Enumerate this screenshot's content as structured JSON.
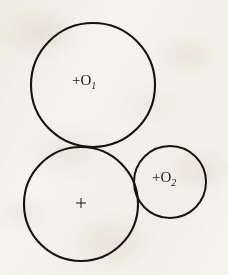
{
  "figure": {
    "name": "three-tangent-circles",
    "background_color": "#f6f4ef",
    "ink_color": "#17140f",
    "media": "scanned-book-page",
    "canvas": {
      "width": 228,
      "height": 275
    }
  },
  "circles": [
    {
      "id": "circle-o1",
      "label": "O",
      "subscript": "1",
      "plus_prefix": "+",
      "center_x": 93,
      "center_y": 85,
      "radius": 62,
      "stroke_width": 2.1,
      "label_x": 72,
      "label_y": 85,
      "has_center_mark": false
    },
    {
      "id": "circle-unlabeled",
      "label": "",
      "subscript": "",
      "plus_prefix": "+",
      "center_x": 81,
      "center_y": 204,
      "radius": 57,
      "stroke_width": 2.1,
      "label_x": 76,
      "label_y": 204,
      "has_center_mark": true
    },
    {
      "id": "circle-o2",
      "label": "O",
      "subscript": "2",
      "plus_prefix": "+",
      "center_x": 170,
      "center_y": 182,
      "radius": 36,
      "stroke_width": 2.0,
      "label_x": 152,
      "label_y": 182,
      "has_center_mark": false
    }
  ],
  "center_mark": {
    "x": 81,
    "y": 203,
    "arm_length": 5
  },
  "labels": {
    "o1": "+O",
    "o1_sub": "1",
    "o2": "+O",
    "o2_sub": "2",
    "center_plus": "+"
  }
}
